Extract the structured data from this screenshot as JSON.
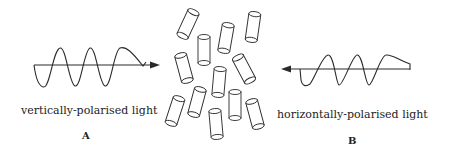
{
  "diagram": {
    "left_panel": {
      "label": "vertically-polarised light",
      "letter": "A",
      "arrow_direction": "right"
    },
    "right_panel": {
      "label": "horizontally-polarised light",
      "letter": "B",
      "arrow_direction": "left"
    },
    "center": {
      "description": "randomly oriented cylindrical molecules",
      "cylinder_count": 12
    },
    "colors": {
      "line": "#2a2a2a",
      "background": "#ffffff"
    }
  }
}
